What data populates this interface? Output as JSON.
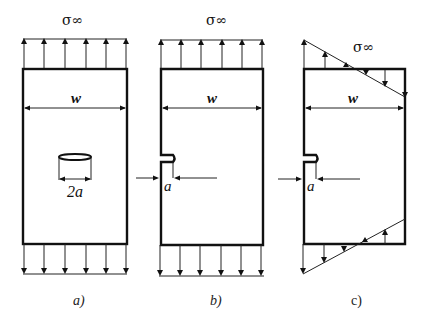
{
  "figure": {
    "panels": [
      {
        "id": "a",
        "caption": "a)",
        "stress_label": "σ∞",
        "width_label": "w",
        "crack_label": "2a",
        "crack_type": "center crack",
        "loading": "uniform tension"
      },
      {
        "id": "b",
        "caption": "b)",
        "stress_label": "σ∞",
        "width_label": "w",
        "crack_label": "a",
        "crack_type": "edge crack",
        "loading": "uniform tension"
      },
      {
        "id": "c",
        "caption": "c)",
        "stress_label": "σ∞",
        "width_label": "w",
        "crack_label": "a",
        "crack_type": "edge crack",
        "loading": "linear bending stress"
      }
    ]
  }
}
